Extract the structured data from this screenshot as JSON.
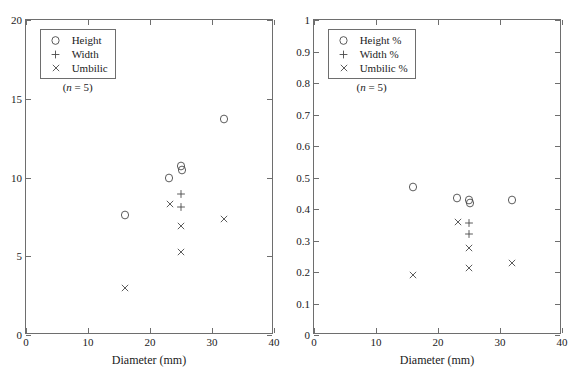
{
  "chart_data": [
    {
      "type": "scatter",
      "panel": "left",
      "title": "",
      "xlabel": "Diameter (mm)",
      "ylabel": "",
      "xlim": [
        0,
        40
      ],
      "ylim": [
        0,
        20
      ],
      "xticks": [
        "0",
        "10",
        "20",
        "30",
        "40"
      ],
      "xtick_values": [
        0,
        10,
        20,
        30,
        40
      ],
      "yticks": [
        "0",
        "5",
        "10",
        "15",
        "20"
      ],
      "ytick_values": [
        0,
        5,
        10,
        15,
        20
      ],
      "grid": false,
      "legend_position": "top-left",
      "legend_note": "(n = 5)",
      "series": [
        {
          "name": "Height",
          "marker": "circle",
          "points": [
            {
              "x": 16.0,
              "y": 7.6
            },
            {
              "x": 23.0,
              "y": 9.95
            },
            {
              "x": 25.0,
              "y": 10.75
            },
            {
              "x": 25.1,
              "y": 10.5
            },
            {
              "x": 32.0,
              "y": 13.7
            }
          ]
        },
        {
          "name": "Width",
          "marker": "plus",
          "points": [
            {
              "x": 25.0,
              "y": 8.95
            },
            {
              "x": 25.0,
              "y": 8.15
            }
          ]
        },
        {
          "name": "Umbilic",
          "marker": "cross",
          "points": [
            {
              "x": 16.0,
              "y": 3.0
            },
            {
              "x": 23.2,
              "y": 8.3
            },
            {
              "x": 25.0,
              "y": 6.9
            },
            {
              "x": 25.0,
              "y": 5.25
            },
            {
              "x": 32.0,
              "y": 7.35
            }
          ]
        }
      ]
    },
    {
      "type": "scatter",
      "panel": "right",
      "title": "",
      "xlabel": "Diameter (mm)",
      "ylabel": "",
      "xlim": [
        0,
        40
      ],
      "ylim": [
        0,
        1
      ],
      "xticks": [
        "0",
        "10",
        "20",
        "30",
        "40"
      ],
      "xtick_values": [
        0,
        10,
        20,
        30,
        40
      ],
      "yticks": [
        "0",
        "0.1",
        "0.2",
        "0.3",
        "0.4",
        "0.5",
        "0.6",
        "0.7",
        "0.8",
        "0.9",
        "1"
      ],
      "ytick_values": [
        0,
        0.1,
        0.2,
        0.3,
        0.4,
        0.5,
        0.6,
        0.7,
        0.8,
        0.9,
        1
      ],
      "grid": false,
      "legend_position": "top-left",
      "legend_note": "(n = 5)",
      "series": [
        {
          "name": "Height %",
          "marker": "circle",
          "points": [
            {
              "x": 16.0,
              "y": 0.47
            },
            {
              "x": 23.0,
              "y": 0.435
            },
            {
              "x": 25.0,
              "y": 0.43
            },
            {
              "x": 25.2,
              "y": 0.42
            },
            {
              "x": 32.0,
              "y": 0.43
            }
          ]
        },
        {
          "name": "Width %",
          "marker": "plus",
          "points": [
            {
              "x": 25.0,
              "y": 0.355
            },
            {
              "x": 25.0,
              "y": 0.32
            }
          ]
        },
        {
          "name": "Umbilic %",
          "marker": "cross",
          "points": [
            {
              "x": 16.0,
              "y": 0.19
            },
            {
              "x": 23.2,
              "y": 0.358
            },
            {
              "x": 25.0,
              "y": 0.277
            },
            {
              "x": 25.0,
              "y": 0.213
            },
            {
              "x": 32.0,
              "y": 0.229
            }
          ]
        }
      ]
    }
  ],
  "colors": {
    "axis": "#6e6e6e",
    "marker": "#4a4a4a",
    "text": "#1a1a1a",
    "background": "#ffffff"
  }
}
